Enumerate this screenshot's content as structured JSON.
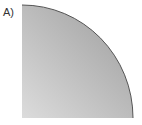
{
  "figure": {
    "label": "A)",
    "shape": "quarter-circle",
    "fill_light": "#d8d8d8",
    "fill_dark": "#9a9a9a",
    "stroke": "#555555"
  }
}
